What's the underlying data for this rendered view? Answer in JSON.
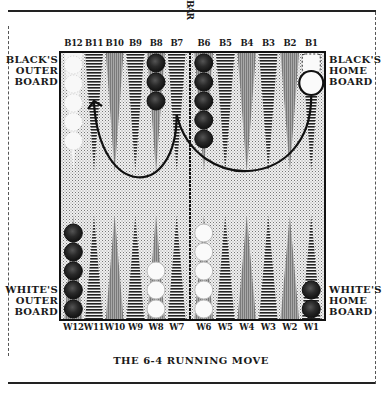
{
  "caption": "THE 6-4 RUNNING MOVE",
  "bar_label": "BAR",
  "labels": {
    "black_outer": [
      "BLACK'S",
      "OUTER",
      "BOARD"
    ],
    "black_home": [
      "BLACK'S",
      "HOME",
      "BOARD"
    ],
    "white_outer": [
      "WHITE'S",
      "OUTER",
      "BOARD"
    ],
    "white_home": [
      "WHITE'S",
      "HOME",
      "BOARD"
    ]
  },
  "top_points": [
    "B12",
    "B11",
    "B10",
    "B9",
    "B8",
    "B7",
    "B6",
    "B5",
    "B4",
    "B3",
    "B2",
    "B1"
  ],
  "bottom_points": [
    "W12",
    "W11",
    "W10",
    "W9",
    "W8",
    "W7",
    "W6",
    "W5",
    "W4",
    "W3",
    "W2",
    "W1"
  ],
  "checkers": {
    "top": [
      {
        "point": "B8",
        "color": "black",
        "count": 3
      },
      {
        "point": "B6",
        "color": "black",
        "count": 5
      },
      {
        "point": "B1",
        "color": "white",
        "count": 1,
        "ghost": 1,
        "highlighted": true
      }
    ],
    "bottom": [
      {
        "point": "W12",
        "color": "black",
        "count": 5
      },
      {
        "point": "W8",
        "color": "white",
        "count": 3
      },
      {
        "point": "W6",
        "color": "white",
        "count": 5
      },
      {
        "point": "W1",
        "color": "black",
        "count": 2
      }
    ],
    "ghost_top": [
      {
        "point": "B12",
        "count": 5
      }
    ]
  },
  "moves": [
    {
      "from": "B1",
      "to": "B7",
      "die": 6
    },
    {
      "from": "B7",
      "to": "B11",
      "die": 4
    }
  ],
  "colors": {
    "ink": "#1a1a1a",
    "board_bg": "#d8d8d8",
    "point_dark": "#3a3a3a",
    "point_light": "#9a9a9a"
  }
}
